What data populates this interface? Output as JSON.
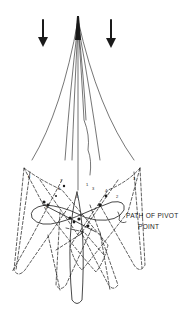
{
  "diagram": {
    "type": "technical-line-drawing",
    "annotation": {
      "line1": "PATH OF PIVOT",
      "line2": "POINT"
    },
    "arrows": [
      {
        "name": "left-downward-arrow",
        "direction": "down"
      },
      {
        "name": "right-downward-arrow",
        "direction": "down"
      }
    ],
    "position_numbers": [
      "1",
      "2",
      "3",
      "4",
      "5",
      "6",
      "7",
      "8"
    ],
    "colors": {
      "ink": "#1a1a1a",
      "background": "#ffffff"
    }
  }
}
